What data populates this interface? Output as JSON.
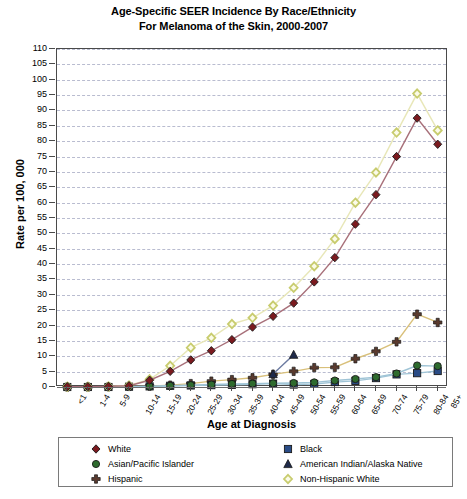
{
  "chart_data": {
    "type": "line",
    "title": "Age-Specific SEER Incidence By Race/Ethnicity",
    "subtitle": "For Melanoma of the Skin, 2000-2007",
    "xlabel": "Age at Diagnosis",
    "ylabel": "Rate per 100, 000",
    "ylim": [
      0,
      110
    ],
    "ytick_step": 5,
    "grid": true,
    "legend_position": "bottom",
    "categories": [
      "<1",
      "1-4",
      "5-9",
      "10-14",
      "15-19",
      "20-24",
      "25-29",
      "30-34",
      "35-39",
      "40-44",
      "45-49",
      "50-54",
      "55-59",
      "60-64",
      "65-69",
      "70-74",
      "75-79",
      "80-84",
      "85+"
    ],
    "yticks": [
      0,
      5,
      10,
      15,
      20,
      25,
      30,
      35,
      40,
      45,
      50,
      55,
      60,
      65,
      70,
      75,
      80,
      85,
      90,
      95,
      100,
      105,
      110
    ],
    "series": [
      {
        "name": "White",
        "marker": "diamond",
        "color": "#7B1A1F",
        "line_color": "#A8707A",
        "values": [
          0.1,
          0.1,
          0.2,
          0.4,
          2.2,
          5.1,
          8.8,
          11.8,
          15.4,
          19.5,
          23.0,
          27.3,
          34.2,
          42.1,
          53.0,
          62.6,
          75.0,
          87.5,
          79.0
        ]
      },
      {
        "name": "Black",
        "marker": "square",
        "color": "#2A4C86",
        "line_color": "#9FC4D6",
        "values": [
          0.0,
          0.0,
          0.0,
          0.1,
          0.2,
          0.4,
          0.5,
          0.6,
          0.7,
          0.9,
          1.1,
          0.8,
          1.0,
          1.6,
          2.0,
          2.9,
          4.1,
          4.5,
          5.2
        ]
      },
      {
        "name": "Asian/Pacific Islander",
        "marker": "circle",
        "color": "#2E6B2E",
        "line_color": "#9FC4D6",
        "values": [
          0.0,
          0.0,
          0.0,
          0.1,
          0.2,
          0.4,
          0.6,
          0.8,
          1.0,
          1.1,
          1.2,
          1.3,
          1.5,
          2.1,
          2.6,
          3.2,
          4.4,
          7.0,
          6.8
        ]
      },
      {
        "name": "American Indian/Alaska Native",
        "marker": "triangle",
        "color": "#1F2A4A",
        "line_color": "#6B7AA0",
        "values": [
          null,
          null,
          null,
          null,
          null,
          null,
          null,
          null,
          null,
          null,
          4.2,
          10.5,
          null,
          null,
          null,
          null,
          null,
          null,
          null
        ]
      },
      {
        "name": "Hispanic",
        "marker": "plus",
        "color": "#5A3A2E",
        "line_color": "#D9C07A",
        "values": [
          0.0,
          0.0,
          0.1,
          0.2,
          0.3,
          0.6,
          1.1,
          1.9,
          2.4,
          3.0,
          4.1,
          5.1,
          6.3,
          6.4,
          9.2,
          11.6,
          14.7,
          23.7,
          21.0
        ]
      },
      {
        "name": "Non-Hispanic White",
        "marker": "diamond-open",
        "color": "#C8CC6E",
        "line_color": "#E8E7B8",
        "values": [
          0.1,
          0.1,
          0.2,
          0.5,
          2.5,
          6.9,
          12.8,
          16.0,
          20.5,
          22.5,
          26.5,
          32.3,
          39.3,
          48.2,
          60.0,
          69.8,
          82.8,
          95.5,
          83.5
        ]
      }
    ]
  },
  "legend": {
    "left_items": [
      "White",
      "Asian/Pacific Islander",
      "Hispanic"
    ],
    "right_items": [
      "Black",
      "American Indian/Alaska Native",
      "Non-Hispanic White"
    ]
  }
}
